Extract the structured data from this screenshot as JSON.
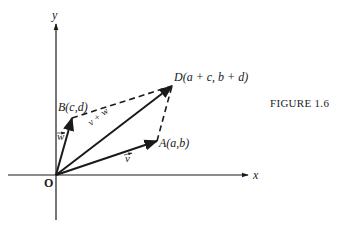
{
  "figure": {
    "caption": "FIGURE 1.6",
    "axes": {
      "x_label": "x",
      "y_label": "y",
      "origin_label": "O"
    },
    "points": {
      "A": {
        "label": "A(a,b)"
      },
      "B": {
        "label": "B(c,d)"
      },
      "D": {
        "label": "D(a + c, b + d)"
      }
    },
    "vectors": {
      "v": {
        "label": "v"
      },
      "w": {
        "label": "w"
      },
      "sum": {
        "label": "v + w"
      }
    },
    "colors": {
      "ink": "#1a1a1a",
      "background": "#ffffff"
    }
  }
}
